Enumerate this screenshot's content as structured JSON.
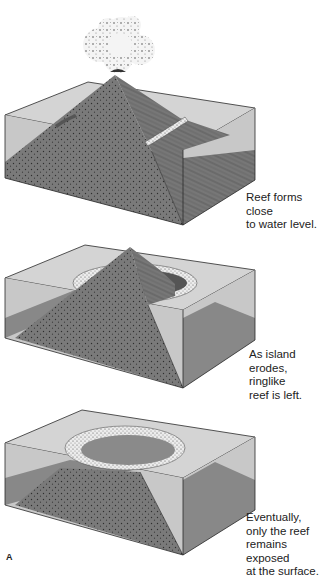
{
  "figure": {
    "panel_label": "A",
    "colors": {
      "water_surface": "#d2d2d2",
      "water_side": "#c6c6c6",
      "rock": "#7a7a7a",
      "rock_dark": "#6a6a6a",
      "seafloor": "#8c8c8c",
      "reef": "#e6e6e6",
      "outline": "#2a2a2a",
      "cloud": "#f2f2f2"
    },
    "stages": [
      {
        "id": "stage-1",
        "caption": [
          "Reef forms close",
          "to water level."
        ]
      },
      {
        "id": "stage-2",
        "caption": [
          "As island",
          "erodes,",
          "ringlike",
          "reef is left."
        ]
      },
      {
        "id": "stage-3",
        "caption": [
          "Eventually,",
          "only the reef",
          "remains exposed",
          "at the surface."
        ]
      }
    ]
  }
}
